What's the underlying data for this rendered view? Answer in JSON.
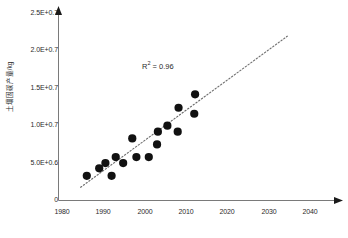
{
  "chart_data": {
    "type": "scatter",
    "title": "",
    "xlabel": "",
    "ylabel": "土壤固碳产量/kg",
    "xlim": [
      1980,
      2045
    ],
    "ylim": [
      0,
      25000000
    ],
    "grid": false,
    "legend": null,
    "x_tick_labels": [
      "1980",
      "1990",
      "2000",
      "2010",
      "2020",
      "2030",
      "2040"
    ],
    "x_tick_values": [
      1980,
      1990,
      2000,
      2010,
      2020,
      2030,
      2040
    ],
    "y_tick_labels": [
      "0",
      "5.0E+0.6",
      "1.0E+0.7",
      "1.5E+0.7",
      "2.0E+0.7",
      "2.5E+0.7"
    ],
    "y_tick_values": [
      0,
      5000000,
      10000000,
      15000000,
      20000000,
      25000000
    ],
    "annotations": [
      {
        "text": "R² = 0.96",
        "x": 2002,
        "y": 17900000
      }
    ],
    "r_squared": "0.96",
    "series": [
      {
        "name": "observations",
        "marker": "filled-circle",
        "color": "#111111",
        "points": [
          {
            "x": 1986,
            "y": 3300000
          },
          {
            "x": 1989,
            "y": 4300000
          },
          {
            "x": 1990.5,
            "y": 5000000
          },
          {
            "x": 1992,
            "y": 3300000
          },
          {
            "x": 1993,
            "y": 5800000
          },
          {
            "x": 1994.8,
            "y": 5000000
          },
          {
            "x": 1997,
            "y": 8300000
          },
          {
            "x": 1998,
            "y": 5800000
          },
          {
            "x": 2001,
            "y": 5800000
          },
          {
            "x": 2003,
            "y": 7500000
          },
          {
            "x": 2003.2,
            "y": 9200000
          },
          {
            "x": 2005.5,
            "y": 10000000
          },
          {
            "x": 2008,
            "y": 9200000
          },
          {
            "x": 2008.2,
            "y": 12400000
          },
          {
            "x": 2012,
            "y": 11600000
          },
          {
            "x": 2012.2,
            "y": 14200000
          }
        ]
      }
    ],
    "trendline": {
      "style": "dotted",
      "color": "#6b6b6b",
      "x_start": 1984.5,
      "y_start": 1700000,
      "x_end": 2034.5,
      "y_end": 21900000
    }
  },
  "axes": {
    "y_axis_title": "土壤固碳产量/kg",
    "x_ticks": [
      {
        "label": "1980"
      },
      {
        "label": "1990"
      },
      {
        "label": "2000"
      },
      {
        "label": "2010"
      },
      {
        "label": "2020"
      },
      {
        "label": "2030"
      },
      {
        "label": "2040"
      }
    ],
    "y_ticks": [
      {
        "label": "2.5E+0.7"
      },
      {
        "label": "2.0E+0.7"
      },
      {
        "label": "1.5E+0.7"
      },
      {
        "label": "1.0E+0.7"
      },
      {
        "label": "5.0E+0.6"
      },
      {
        "label": "0"
      }
    ]
  },
  "annotation": {
    "r2_prefix": "R",
    "r2_exp": "2",
    "r2_value": " = 0.96"
  },
  "colors": {
    "marker": "#111111",
    "trendline": "#6b6b6b",
    "axis": "#7a7a7a",
    "text": "#2b2b2b",
    "background": "#ffffff"
  }
}
